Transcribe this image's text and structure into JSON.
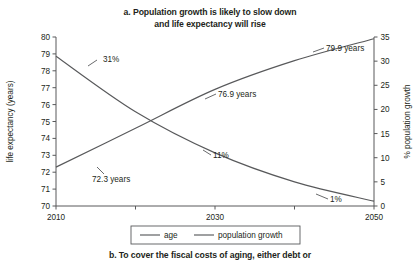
{
  "figure": {
    "panel_label": "a.",
    "title_line1": "a. Population growth is likely to slow down",
    "title_line2": "and life expectancy will rise",
    "next_panel_caption": "b. To cover the fiscal costs of aging, either debt or",
    "background_color": "#ffffff",
    "ink_color": "#58595b",
    "text_color": "#231f20"
  },
  "chart_data": {
    "type": "line",
    "title": "a. Population growth is likely to slow down and life expectancy will rise",
    "xlabel": "",
    "x": [
      2010,
      2020,
      2030,
      2040,
      2050
    ],
    "xlim": [
      2010,
      2050
    ],
    "xtick_labels": [
      "2010",
      "2030",
      "2050"
    ],
    "xticks_major": [
      2010,
      2030,
      2050
    ],
    "xticks_minor": [
      2020,
      2040
    ],
    "grid": false,
    "legend_position": "bottom-center",
    "axes": [
      {
        "id": "left",
        "ylabel": "life expectancy (years)",
        "ylim": [
          70,
          80
        ],
        "ytick_labels": [
          "70",
          "71",
          "72",
          "73",
          "74",
          "75",
          "76",
          "77",
          "78",
          "79",
          "80"
        ],
        "yticks": [
          70,
          71,
          72,
          73,
          74,
          75,
          76,
          77,
          78,
          79,
          80
        ]
      },
      {
        "id": "right",
        "ylabel": "% population growth",
        "ylim": [
          0,
          35
        ],
        "ytick_labels": [
          "0",
          "5",
          "10",
          "15",
          "20",
          "25",
          "30",
          "35"
        ],
        "yticks": [
          0,
          5,
          10,
          15,
          20,
          25,
          30,
          35
        ]
      }
    ],
    "series": [
      {
        "name": "age",
        "axis": "left",
        "units": "years",
        "values": [
          72.3,
          74.6,
          76.9,
          78.6,
          79.9
        ]
      },
      {
        "name": "population growth",
        "axis": "right",
        "units": "%",
        "values": [
          31,
          19.5,
          11,
          5,
          1
        ]
      }
    ],
    "annotations": [
      {
        "text": "31%",
        "series": "population growth",
        "x": 2010,
        "value": 31
      },
      {
        "text": "11%",
        "series": "population growth",
        "x": 2030,
        "value": 11
      },
      {
        "text": "1%",
        "series": "population growth",
        "x": 2050,
        "value": 1
      },
      {
        "text": "72.3 years",
        "series": "age",
        "x": 2010,
        "value": 72.3
      },
      {
        "text": "76.9 years",
        "series": "age",
        "x": 2030,
        "value": 76.9
      },
      {
        "text": "79.9 years",
        "series": "age",
        "x": 2050,
        "value": 79.9
      }
    ],
    "legend": [
      {
        "label": "age"
      },
      {
        "label": "population growth"
      }
    ]
  }
}
